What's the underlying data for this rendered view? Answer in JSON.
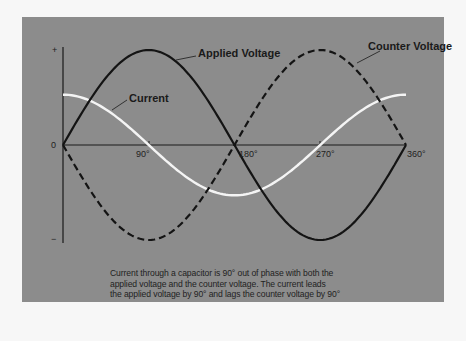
{
  "chart_data": {
    "type": "line",
    "title": "",
    "xlabel": "",
    "ylabel": "",
    "x_ticks": [
      "0",
      "90°",
      "180°",
      "270°",
      "360°"
    ],
    "y_ticks": [
      "+",
      "0",
      "−"
    ],
    "x_degrees": [
      0,
      45,
      90,
      135,
      180,
      225,
      270,
      315,
      360
    ],
    "series": [
      {
        "name": "Applied Voltage",
        "style": "solid black",
        "values": [
          0,
          0.707,
          1,
          0.707,
          0,
          -0.707,
          -1,
          -0.707,
          0
        ]
      },
      {
        "name": "Counter Voltage",
        "style": "dashed black",
        "values": [
          0,
          -0.707,
          -1,
          -0.707,
          0,
          0.707,
          1,
          0.707,
          0
        ]
      },
      {
        "name": "Current",
        "style": "solid white",
        "values": [
          0.53,
          0.37,
          0,
          -0.37,
          -0.53,
          -0.37,
          0,
          0.37,
          0.53
        ]
      }
    ],
    "ylim": [
      -1,
      1
    ],
    "xlim": [
      0,
      360
    ],
    "grid": false
  },
  "labels": {
    "applied": "Applied Voltage",
    "counter": "Counter Voltage",
    "current": "Current",
    "plus": "+",
    "minus": "−",
    "zero": "0",
    "t90": "90°",
    "t180": "180°",
    "t270": "270°",
    "t360": "360°"
  },
  "caption": {
    "line1": "Current through a capacitor is 90° out of phase with both the",
    "line2": "applied voltage and the counter voltage.  The current leads",
    "line3": "the applied voltage by 90° and lags the counter voltage by 90°"
  }
}
